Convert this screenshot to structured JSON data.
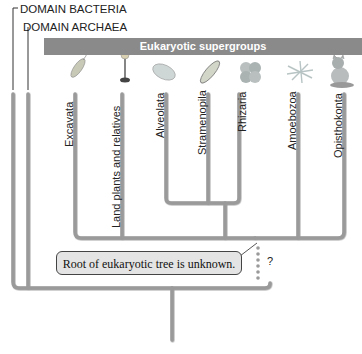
{
  "domains": {
    "bacteria": "DOMAIN BACTERIA",
    "archaea": "DOMAIN ARCHAEA"
  },
  "banner": {
    "title": "Eukaryotic supergroups",
    "color": "#8a8a8a"
  },
  "supergroups": [
    {
      "label": "Excavata",
      "icon": "flagellate-icon"
    },
    {
      "label": "Land plants and relatives",
      "icon": "plant-icon"
    },
    {
      "label": "Alveolata",
      "icon": "ciliate-icon"
    },
    {
      "label": "Stramenopila",
      "icon": "diatom-icon"
    },
    {
      "label": "Rhizaria",
      "icon": "foraminifera-icon"
    },
    {
      "label": "Amoebozoa",
      "icon": "amoeba-icon"
    },
    {
      "label": "Opisthokonta",
      "icon": "cat-icon"
    }
  ],
  "callout": {
    "text": "Root of eukaryotic tree is unknown.",
    "uncertain_marker": "?"
  },
  "colors": {
    "branch": "#9a9a9a",
    "branch_shadow": "#6e6e6e",
    "callout_bg": "#e4e4e4"
  }
}
